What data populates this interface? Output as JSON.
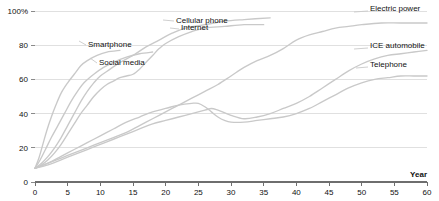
{
  "chart_data": {
    "type": "line",
    "title": "",
    "subtitle": "",
    "xlabel": "Year",
    "ylabel": "",
    "xlim": [
      0,
      60
    ],
    "ylim": [
      0,
      100
    ],
    "grid": true,
    "grid_axis": "y",
    "legend_position": "inline-labels",
    "x_ticks": [
      0,
      5,
      10,
      15,
      20,
      25,
      30,
      35,
      40,
      45,
      50,
      55,
      60
    ],
    "x_tick_labels": [
      "0",
      "5",
      "10",
      "15",
      "20",
      "25",
      "30",
      "35",
      "40",
      "45",
      "50",
      "55",
      "60"
    ],
    "y_ticks": [
      0,
      20,
      40,
      60,
      80,
      100
    ],
    "y_tick_labels": [
      "0",
      "20",
      "40",
      "60",
      "80",
      "100%"
    ],
    "line_color": "#c9c9c9",
    "grid_color": "#d8d8d8",
    "axis_color": "#6e6e6e",
    "series": [
      {
        "name": "Smartphone",
        "label": "Smartphone",
        "label_x": 88,
        "label_y": 47,
        "leader": "M 86 45 L 79 41",
        "points": [
          [
            0,
            8
          ],
          [
            0.6,
            14
          ],
          [
            1.2,
            22
          ],
          [
            1.8,
            30
          ],
          [
            2.5,
            38
          ],
          [
            3.2,
            45
          ],
          [
            4,
            52
          ],
          [
            5,
            58
          ],
          [
            6,
            63
          ],
          [
            7,
            68
          ],
          [
            8,
            71
          ],
          [
            9.5,
            74
          ],
          [
            11,
            76
          ],
          [
            13,
            77
          ]
        ]
      },
      {
        "name": "Social media",
        "label": "Social media",
        "label_x": 99,
        "label_y": 65,
        "leader": "M 97 63 L 90 58",
        "points": [
          [
            0,
            8
          ],
          [
            0.8,
            13
          ],
          [
            1.6,
            19
          ],
          [
            2.5,
            26
          ],
          [
            3.5,
            33
          ],
          [
            4.5,
            40
          ],
          [
            5.5,
            47
          ],
          [
            6.5,
            53
          ],
          [
            7.5,
            58
          ],
          [
            9,
            63
          ],
          [
            10.5,
            67
          ],
          [
            12,
            70
          ],
          [
            14,
            73
          ],
          [
            16,
            75
          ],
          [
            18,
            76
          ]
        ]
      },
      {
        "name": "Cellular phone",
        "label": "Cellular phone",
        "label_x": 176,
        "label_y": 23,
        "leader": "M 174 21 L 163 20",
        "points": [
          [
            0,
            8
          ],
          [
            1,
            11
          ],
          [
            2,
            15
          ],
          [
            3,
            20
          ],
          [
            4,
            26
          ],
          [
            5,
            33
          ],
          [
            6,
            40
          ],
          [
            7,
            47
          ],
          [
            8,
            53
          ],
          [
            9,
            58
          ],
          [
            10,
            62
          ],
          [
            11.5,
            66
          ],
          [
            13,
            70
          ],
          [
            15,
            74
          ],
          [
            17,
            79
          ],
          [
            19,
            83
          ],
          [
            21,
            87
          ],
          [
            23,
            90
          ],
          [
            26,
            92
          ],
          [
            29,
            94
          ],
          [
            32,
            95
          ],
          [
            36,
            96
          ]
        ]
      },
      {
        "name": "Internet",
        "label": "Internet",
        "label_x": 181,
        "label_y": 30,
        "leader": "M 179 29 L 170 28",
        "points": [
          [
            0,
            8
          ],
          [
            1,
            10
          ],
          [
            2,
            13
          ],
          [
            3,
            17
          ],
          [
            4,
            22
          ],
          [
            5,
            28
          ],
          [
            6,
            34
          ],
          [
            7,
            40
          ],
          [
            8,
            45
          ],
          [
            9,
            50
          ],
          [
            10,
            54
          ],
          [
            11,
            57
          ],
          [
            12,
            59
          ],
          [
            13,
            61
          ],
          [
            14,
            62
          ],
          [
            15,
            63
          ],
          [
            16,
            66
          ],
          [
            17,
            70
          ],
          [
            18,
            74
          ],
          [
            19,
            78
          ],
          [
            20,
            81
          ],
          [
            22,
            85
          ],
          [
            24,
            88
          ],
          [
            26,
            90
          ],
          [
            29,
            91
          ],
          [
            32,
            92
          ],
          [
            35,
            92
          ]
        ]
      },
      {
        "name": "Electric power",
        "label": "Electric power",
        "label_x": 370,
        "label_y": 11,
        "leader": "M 368 11 L 354 12",
        "points": [
          [
            0,
            8
          ],
          [
            2,
            11
          ],
          [
            4,
            14
          ],
          [
            6,
            17
          ],
          [
            8,
            20
          ],
          [
            10,
            23
          ],
          [
            12,
            26
          ],
          [
            14,
            29
          ],
          [
            16,
            33
          ],
          [
            18,
            37
          ],
          [
            20,
            41
          ],
          [
            22,
            45
          ],
          [
            24,
            49
          ],
          [
            26,
            53
          ],
          [
            28,
            57
          ],
          [
            30,
            62
          ],
          [
            32,
            67
          ],
          [
            34,
            71
          ],
          [
            36,
            74
          ],
          [
            38,
            78
          ],
          [
            40,
            83
          ],
          [
            42,
            86
          ],
          [
            44,
            88
          ],
          [
            46,
            90
          ],
          [
            48,
            91
          ],
          [
            50,
            92
          ],
          [
            53,
            93
          ],
          [
            56,
            93
          ],
          [
            60,
            93
          ]
        ]
      },
      {
        "name": "ICE automobile",
        "label": "ICE automobile",
        "label_x": 370,
        "label_y": 48,
        "leader": "M 368 48 L 354 49",
        "points": [
          [
            0,
            8
          ],
          [
            2,
            10
          ],
          [
            4,
            13
          ],
          [
            6,
            16
          ],
          [
            8,
            19
          ],
          [
            10,
            22
          ],
          [
            12,
            25
          ],
          [
            14,
            28
          ],
          [
            16,
            31
          ],
          [
            18,
            34
          ],
          [
            20,
            36
          ],
          [
            22,
            38
          ],
          [
            24,
            40
          ],
          [
            26,
            42
          ],
          [
            27,
            43
          ],
          [
            28,
            42
          ],
          [
            30,
            39
          ],
          [
            32,
            37
          ],
          [
            34,
            38
          ],
          [
            36,
            40
          ],
          [
            38,
            43
          ],
          [
            40,
            46
          ],
          [
            42,
            50
          ],
          [
            44,
            55
          ],
          [
            46,
            60
          ],
          [
            48,
            65
          ],
          [
            50,
            69
          ],
          [
            52,
            72
          ],
          [
            54,
            74
          ],
          [
            56,
            75
          ],
          [
            58,
            76
          ],
          [
            60,
            77
          ]
        ]
      },
      {
        "name": "Telephone",
        "label": "Telephone",
        "label_x": 370,
        "label_y": 67,
        "leader": "M 368 67 L 356 68",
        "points": [
          [
            0,
            8
          ],
          [
            2,
            11
          ],
          [
            4,
            15
          ],
          [
            6,
            19
          ],
          [
            8,
            23
          ],
          [
            10,
            27
          ],
          [
            12,
            31
          ],
          [
            14,
            35
          ],
          [
            16,
            38
          ],
          [
            18,
            41
          ],
          [
            20,
            43
          ],
          [
            22,
            45
          ],
          [
            24,
            46
          ],
          [
            25,
            46
          ],
          [
            26,
            44
          ],
          [
            27,
            41
          ],
          [
            28,
            38
          ],
          [
            29,
            36
          ],
          [
            30,
            35
          ],
          [
            32,
            35
          ],
          [
            34,
            36
          ],
          [
            36,
            37
          ],
          [
            38,
            38
          ],
          [
            40,
            40
          ],
          [
            42,
            43
          ],
          [
            44,
            47
          ],
          [
            46,
            51
          ],
          [
            48,
            55
          ],
          [
            50,
            58
          ],
          [
            52,
            60
          ],
          [
            54,
            61
          ],
          [
            56,
            62
          ],
          [
            58,
            62
          ],
          [
            60,
            62
          ]
        ]
      }
    ]
  }
}
